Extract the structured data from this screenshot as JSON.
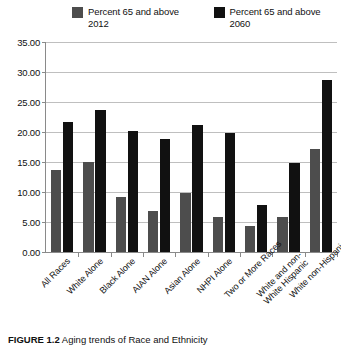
{
  "figure": {
    "caption_label": "FIGURE 1.2",
    "caption_text": "Aging trends of Race and Ethnicity"
  },
  "legend": {
    "position": "top",
    "entries": [
      {
        "label": "Percent 65 and\nabove 2012",
        "color": "#4d4d4d",
        "swatch_name": "legend-swatch-2012"
      },
      {
        "label": "Percent 65 and\nabove 2060",
        "color": "#111111",
        "swatch_name": "legend-swatch-2060"
      }
    ]
  },
  "chart_data": {
    "type": "bar",
    "title": "",
    "subtitle": "",
    "xlabel": "",
    "ylabel": "",
    "ylim": [
      0,
      35
    ],
    "ytick_labels": [
      "0.00",
      "5.00",
      "10.00",
      "15.00",
      "20.00",
      "25.00",
      "30.00",
      "35.00"
    ],
    "yticks": [
      0,
      5,
      10,
      15,
      20,
      25,
      30,
      35
    ],
    "grid": true,
    "legend_position": "top",
    "categories": [
      "All Races",
      "White Alone",
      "Black Alone",
      "AIAN Alone",
      "Asian Alone",
      "NHPI Alone",
      "Two or More Races",
      "White and non-White Hispanic",
      "White non-Hispanic"
    ],
    "series": [
      {
        "name": "Percent 65 and above 2012",
        "color": "#4d4d4d",
        "values": [
          13.7,
          15.0,
          9.1,
          6.8,
          9.9,
          5.8,
          4.3,
          5.8,
          17.1
        ]
      },
      {
        "name": "Percent 65 and above 2060",
        "color": "#111111",
        "values": [
          21.7,
          23.6,
          20.1,
          18.8,
          21.1,
          19.9,
          7.9,
          14.9,
          28.6
        ]
      }
    ]
  }
}
